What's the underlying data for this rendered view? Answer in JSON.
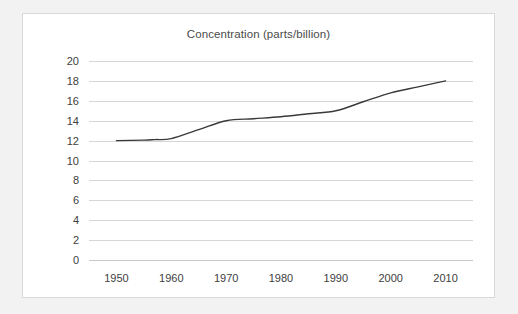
{
  "chart_data": {
    "type": "line",
    "title": "Concentration (parts/billion)",
    "xlabel": "",
    "ylabel": "",
    "x": [
      1950,
      1960,
      1970,
      1980,
      1990,
      2000,
      2010
    ],
    "series": [
      {
        "name": "Concentration",
        "color": "#3a3a3a",
        "values": [
          12.0,
          12.2,
          14.0,
          14.4,
          15.0,
          16.8,
          18.0
        ]
      }
    ],
    "dense_points": [
      {
        "x": 1950,
        "y": 12.0
      },
      {
        "x": 1955,
        "y": 12.05
      },
      {
        "x": 1957,
        "y": 12.1
      },
      {
        "x": 1960,
        "y": 12.2
      },
      {
        "x": 1965,
        "y": 13.1
      },
      {
        "x": 1970,
        "y": 14.0
      },
      {
        "x": 1975,
        "y": 14.2
      },
      {
        "x": 1980,
        "y": 14.4
      },
      {
        "x": 1985,
        "y": 14.7
      },
      {
        "x": 1990,
        "y": 15.0
      },
      {
        "x": 1995,
        "y": 15.9
      },
      {
        "x": 2000,
        "y": 16.8
      },
      {
        "x": 2005,
        "y": 17.4
      },
      {
        "x": 2010,
        "y": 18.0
      }
    ],
    "xlim": [
      1945,
      2015
    ],
    "ylim": [
      0,
      20
    ],
    "ytick_labels": [
      "20",
      "18",
      "16",
      "14",
      "12",
      "10",
      "8",
      "6",
      "4",
      "2",
      "0"
    ],
    "ytick_values": [
      20,
      18,
      16,
      14,
      12,
      10,
      8,
      6,
      4,
      2,
      0
    ],
    "xtick_labels": [
      "1950",
      "1960",
      "1970",
      "1980",
      "1990",
      "2000",
      "2010"
    ],
    "xtick_values": [
      1950,
      1960,
      1970,
      1980,
      1990,
      2000,
      2010
    ],
    "grid": true,
    "grid_axis": "y",
    "legend": false,
    "legend_position": "none",
    "colors": {
      "line": "#3a3a3a",
      "grid": "#d6d6d6",
      "axis": "#c8c8c8",
      "text": "#404040",
      "title_text": "#4a4a4a",
      "plot_background": "#ffffff",
      "page_background": "#f2f2f2",
      "card_border": "#d9d9d9"
    }
  }
}
